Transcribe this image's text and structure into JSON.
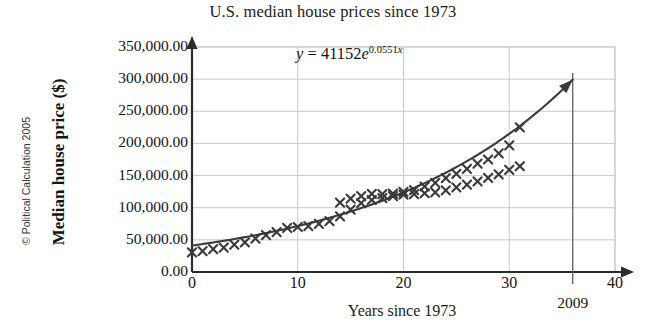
{
  "chart_data": {
    "type": "scatter",
    "title": "U.S. median house prices since 1973",
    "xlabel": "Years since 1973",
    "ylabel": "Median house price ($)",
    "xlim": [
      0,
      40
    ],
    "ylim": [
      0,
      350000
    ],
    "grid": true,
    "legend": "none",
    "xticks": [
      "0",
      "10",
      "20",
      "30",
      "40"
    ],
    "xtick_values": [
      0,
      10,
      20,
      30,
      40
    ],
    "yticks": [
      "0.00",
      "50,000.00",
      "100,000.00",
      "150,000.00",
      "200,000.00",
      "250,000.00",
      "300,000.00",
      "350,000.00"
    ],
    "ytick_values": [
      0,
      50000,
      100000,
      150000,
      200000,
      250000,
      300000,
      350000
    ],
    "series": [
      {
        "name": "Median house price data",
        "marker": "x",
        "color": "#3a3a3a",
        "x": [
          0,
          1,
          2,
          3,
          4,
          5,
          6,
          7,
          8,
          9,
          10,
          11,
          12,
          13,
          14,
          15,
          16,
          17,
          18,
          19,
          20,
          21,
          22,
          23,
          24,
          25,
          26,
          27,
          28,
          29,
          30,
          31
        ],
        "y": [
          30500,
          32500,
          35500,
          38000,
          42500,
          46000,
          52000,
          57500,
          62000,
          68500,
          70000,
          71500,
          75000,
          79000,
          86500,
          97000,
          107000,
          112000,
          115000,
          118000,
          120500,
          121000,
          122500,
          124000,
          127000,
          131500,
          136000,
          141000,
          146500,
          152000,
          159000,
          164500
        ]
      },
      {
        "name": "Median house price data (upper cluster)",
        "marker": "x",
        "color": "#3a3a3a",
        "x": [
          14,
          15,
          16,
          17,
          18,
          19,
          20,
          21,
          22,
          23,
          24,
          25,
          26,
          27,
          28,
          29,
          30,
          31
        ],
        "y": [
          108000,
          114000,
          118000,
          121500,
          121000,
          122000,
          124500,
          127500,
          133000,
          138500,
          146000,
          152500,
          160500,
          168500,
          175000,
          184500,
          197000,
          225000
        ]
      }
    ],
    "fit_curve": {
      "name": "Exponential trendline",
      "equation_text": "y = 41152e^0.0551x",
      "coefficient": 41152,
      "exponent_rate": 0.0551,
      "color": "#3a3a3a",
      "x_start": 0,
      "x_end": 36,
      "arrow_end": true
    },
    "annotations": [
      {
        "name": "equation-label",
        "prefix": "y",
        "equals": "=",
        "coefficient": "41152",
        "base": "e",
        "exponent_coefficient": "0.0551",
        "exponent_variable": "x",
        "full_text": "y = 41152e0.0551x"
      },
      {
        "name": "year-marker",
        "label": "2009",
        "x_value": 36,
        "type": "vertical-line"
      }
    ],
    "copyright": "© Political Calculation 2005"
  },
  "style": {
    "background": "#ffffff",
    "axis_color": "#2b2b2b",
    "grid_color": "#c9c9c9",
    "data_color": "#3a3a3a",
    "text_color": "#141414"
  }
}
